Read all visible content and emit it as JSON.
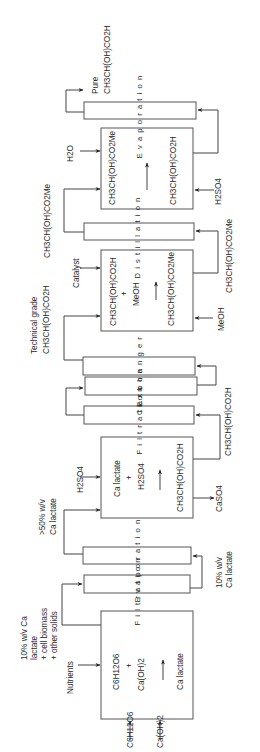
{
  "diagram": {
    "orientation": "rotated 90° counter-clockwise",
    "units": {
      "fermenter": {
        "inputs": [
          "C6H12O6",
          "Ca(OH)2",
          "Nutrients"
        ],
        "line1": "C6H12O6",
        "line2": "+",
        "line3": "Ca(OH)2",
        "line4": "Ca lactate",
        "output_label_1": "10% w/v Ca",
        "output_label_2": "lactate",
        "output_label_3": "+ cell biomass",
        "output_label_4": "+ other solids"
      },
      "filtration_1": {
        "label": "Filtration",
        "output_label_1": "10% w/v",
        "output_label_2": "Ca lactate"
      },
      "evaporation_1": {
        "label": "Evaporation",
        "output_label_1": ">50% w/v",
        "output_label_2": "Ca lactate"
      },
      "acidification": {
        "input": "H2SO4",
        "line1": "Ca lactate",
        "line2": "+",
        "line3": "H2SO4",
        "line4": "CH3CH(OH)CO2H",
        "byproduct": "CaSO4",
        "output_label": "CH3CH(OH)CO2H"
      },
      "filtration_2": {
        "label": "Filtration"
      },
      "carbon": {
        "label": "Carbon"
      },
      "exchanger": {
        "label": "Exchanger",
        "output_label_1": "Technical grade",
        "output_label_2": "CH3CH(OH)CO2H"
      },
      "esterification": {
        "input_catalyst": "Catalyst",
        "input_methanol": "MeOH",
        "line1": "CH3CH(OH)CO2H",
        "line2": "+",
        "line3": "MeOH",
        "line4": "CH3CH(OH)CO2Me",
        "output_label": "CH3CH(OH)CO2Me"
      },
      "distillation": {
        "label": "Distillation",
        "output_label": "CH3CH(OH)CO2Me"
      },
      "hydrolysis": {
        "input_water": "H2O",
        "input_acid": "H2SO4",
        "line1": "CH3CH(OH)CO2Me",
        "line2": "CH3CH(OH)CO2H"
      },
      "evaporation_2": {
        "label": "Evaporation",
        "output_label_1": "Pure",
        "output_label_2": "CH3CH(OH)CO2H"
      }
    },
    "colors": {
      "line": "#444444",
      "text": "#2a2a2a",
      "background": "#ffffff"
    }
  }
}
